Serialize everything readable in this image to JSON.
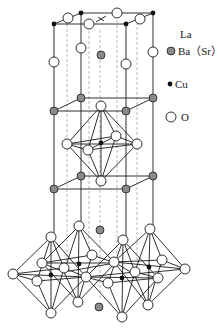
{
  "legend": {
    "items": [
      {
        "symbol": "hatched-circle",
        "label_line1": "La",
        "label_line2": "Ba（Sr）"
      },
      {
        "symbol": "small-black-dot",
        "label": "Cu"
      },
      {
        "symbol": "open-circle",
        "label": "O"
      }
    ]
  },
  "colors": {
    "line": "#1a1a1a",
    "dashed_line": "#9a9a9a",
    "oxygen_fill": "#ffffff",
    "copper_fill": "#111111",
    "la_ba_fill": "#8a8a8a"
  }
}
